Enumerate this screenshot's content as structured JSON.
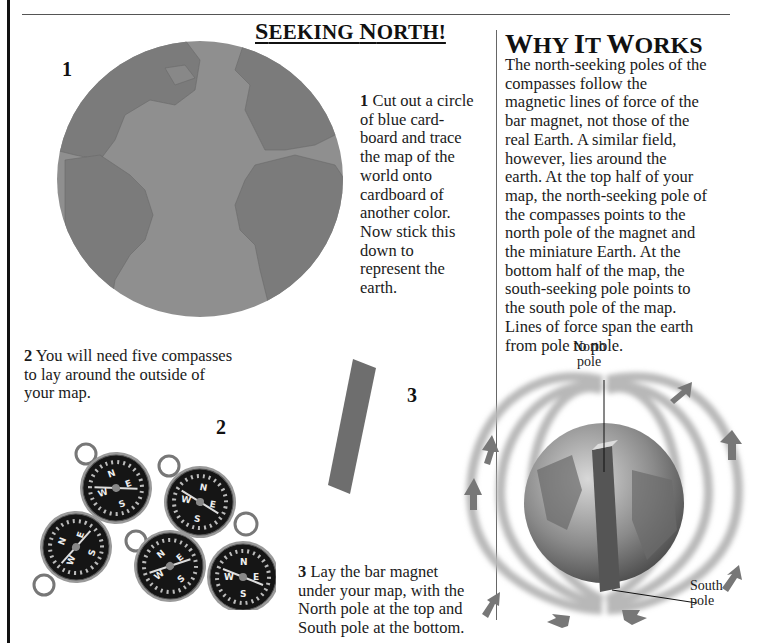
{
  "page": {
    "title": "Seeking North!",
    "title_parts": [
      "S",
      "EEKING ",
      "N",
      "ORTH!"
    ]
  },
  "steps": [
    {
      "number": "1",
      "figure_label": "1",
      "text": "Cut out a circle of blue card-board and trace the map of the world onto cardboard of another color. Now stick this down to represent the earth.",
      "lines": [
        "Cut out a circle",
        "of blue card-",
        "board and trace",
        "the map of the",
        "world onto",
        "cardboard of",
        "another color.",
        "Now stick this",
        "down to",
        "represent the",
        "earth."
      ]
    },
    {
      "number": "2",
      "figure_label": "2",
      "text": "You will need five compasses to lay around the outside of your map.",
      "lines": [
        "You will need five compasses",
        "to lay around the outside of",
        "your map."
      ]
    },
    {
      "number": "3",
      "figure_label": "3",
      "text": "Lay the bar magnet under your map, with the North pole at the top and South pole at the bottom.",
      "lines": [
        "Lay the bar magnet",
        "under your map, with the",
        "North pole at the top and",
        "South pole at the bottom."
      ]
    }
  ],
  "why": {
    "title": "Why It Works",
    "title_parts": [
      "W",
      "HY ",
      "I",
      "T ",
      "W",
      "ORKS"
    ],
    "lines": [
      "The north-seeking poles of the",
      "compasses follow the",
      "magnetic lines of force of the",
      "bar magnet, not those of the",
      "real Earth. A similar field,",
      "however, lies around the",
      "earth. At the top half of your",
      "map, the north-seeking pole of",
      "the compasses points to the",
      "north pole of the magnet and",
      "the miniature Earth. At the",
      "bottom half of the map, the",
      "south-seeking pole points to",
      "the south pole of the map.",
      "Lines of force span the earth",
      "from pole to pole."
    ]
  },
  "diagram": {
    "north_label": [
      "North",
      "pole"
    ],
    "south_label": [
      "South",
      "pole"
    ]
  },
  "compasses": {
    "count": 5,
    "letters": [
      "N",
      "E",
      "S",
      "W"
    ]
  },
  "colors": {
    "globe_ocean": "#8f8f8f",
    "globe_land": "#7a7a7a",
    "magnet": "#6e6e6e",
    "arrow": "#777777",
    "field_line": "#b5b5b5",
    "compass_face": "#151515"
  }
}
